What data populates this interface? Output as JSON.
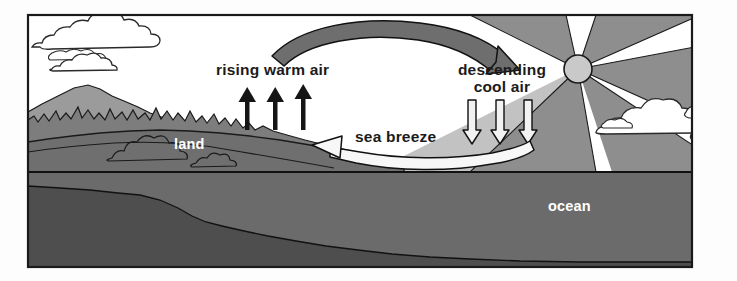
{
  "diagram": {
    "labels": {
      "rising_warm_air": "rising warm air",
      "descending_line1": "descending",
      "descending_line2": "cool air",
      "sea_breeze": "sea breeze",
      "land": "land",
      "ocean": "ocean"
    },
    "colors": {
      "frame_stroke": "#1a1a1a",
      "background": "#ffffff",
      "sky": "#ffffff",
      "sun_disc": "#c9c9c9",
      "sun_ray": "#8e8e8e",
      "mountain_far": "#9b9b9b",
      "mountain_mid": "#7d7d7d",
      "land_fore": "#6f6f6f",
      "ocean_water": "#6b6b6b",
      "ocean_floor": "#4e4e4e",
      "warm_arrow": "#6e6e6e",
      "cool_arrow_fill": "#f2f2f2",
      "rising_arrow": "#151515",
      "label_dark": "#1b1b1b",
      "label_light": "#ffffff"
    },
    "elements": {
      "sun": {
        "name": "sun",
        "rays": 6,
        "cx": 578,
        "cy": 69,
        "r": 14
      },
      "cloud_left": {
        "name": "cloud-left-upper"
      },
      "cloud_left_lower": {
        "name": "cloud-left-lower"
      },
      "cloud_right": {
        "name": "cloud-right"
      },
      "rising_arrows": {
        "count": 3,
        "direction": "up",
        "style": "solid-black"
      },
      "descending_arrows": {
        "count": 3,
        "direction": "down",
        "style": "outlined-white"
      },
      "aloft_arrow": {
        "direction": "left-to-right-curved",
        "style": "filled-gray"
      },
      "surface_arrow": {
        "direction": "right-to-left-curved",
        "style": "outlined-white"
      }
    }
  }
}
